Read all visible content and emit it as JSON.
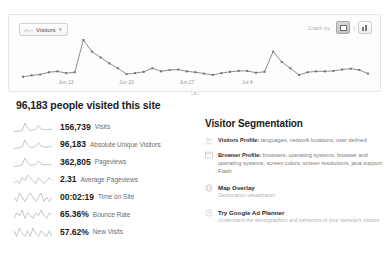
{
  "chart": {
    "metric_selector": {
      "label": "Visitors",
      "caret": "▾",
      "icon": "sparkline-icon"
    },
    "toolbar": {
      "right_label": "Graph by:",
      "line_view_title": "Line chart view",
      "separator": "|",
      "bar_view_title": "Bar chart view"
    },
    "expand_handle": "▾"
  },
  "chart_data": {
    "type": "line",
    "title": "Visitors",
    "xlabel": "",
    "ylabel": "Visitors",
    "grid": false,
    "legend": false,
    "axis_tick_labels": [
      "Jun 13",
      "Jun 20",
      "Jun 27",
      "Jul 4"
    ],
    "axis_tick_positions": [
      5,
      12,
      19,
      26
    ],
    "ylim": [
      0,
      100
    ],
    "x": [
      0,
      1,
      2,
      3,
      4,
      5,
      6,
      7,
      8,
      9,
      10,
      11,
      12,
      13,
      14,
      15,
      16,
      17,
      18,
      19,
      20,
      21,
      22,
      23,
      24,
      25,
      26,
      27,
      28,
      29,
      30,
      31,
      32,
      33,
      34,
      35,
      36,
      37,
      38,
      39,
      40
    ],
    "values": [
      14,
      17,
      19,
      24,
      26,
      22,
      24,
      96,
      70,
      57,
      44,
      33,
      20,
      22,
      25,
      33,
      26,
      29,
      30,
      26,
      24,
      21,
      18,
      22,
      25,
      27,
      27,
      23,
      25,
      70,
      47,
      33,
      18,
      24,
      26,
      26,
      27,
      30,
      32,
      29,
      21
    ],
    "series": [
      {
        "name": "Visitors",
        "values": [
          14,
          17,
          19,
          24,
          26,
          22,
          24,
          96,
          70,
          57,
          44,
          33,
          20,
          22,
          25,
          33,
          26,
          29,
          30,
          26,
          24,
          21,
          18,
          22,
          25,
          27,
          27,
          23,
          25,
          70,
          47,
          33,
          18,
          24,
          26,
          26,
          27,
          30,
          32,
          29,
          21
        ]
      }
    ]
  },
  "headline": "96,183 people visited this site",
  "metrics": [
    {
      "value": "156,739",
      "label": "Visits",
      "sparkline": [
        12,
        14,
        16,
        22,
        80,
        40,
        20,
        24,
        30,
        60,
        34,
        26,
        28,
        30,
        28
      ],
      "icon": "sparkline-icon"
    },
    {
      "value": "96,183",
      "label": "Absolute Unique Visitors",
      "sparkline": [
        14,
        16,
        20,
        26,
        78,
        42,
        22,
        24,
        28,
        58,
        32,
        24,
        26,
        28,
        26
      ],
      "icon": "sparkline-icon"
    },
    {
      "value": "362,805",
      "label": "Pageviews",
      "sparkline": [
        16,
        18,
        22,
        28,
        76,
        44,
        24,
        26,
        30,
        56,
        34,
        28,
        30,
        32,
        28
      ],
      "icon": "sparkline-icon"
    },
    {
      "value": "2.31",
      "label": "Average Pageviews",
      "sparkline": [
        30,
        31,
        30,
        32,
        31,
        33,
        32,
        31,
        30,
        32,
        31,
        30,
        31,
        32,
        31
      ],
      "icon": "sparkline-icon"
    },
    {
      "value": "00:02:19",
      "label": "Time on Site",
      "sparkline": [
        31,
        30,
        32,
        31,
        30,
        31,
        32,
        31,
        30,
        31,
        32,
        30,
        31,
        30,
        31
      ],
      "icon": "sparkline-icon"
    },
    {
      "value": "65.36%",
      "label": "Bounce Rate",
      "sparkline": [
        30,
        32,
        31,
        33,
        30,
        32,
        31,
        30,
        32,
        31,
        33,
        31,
        30,
        32,
        31
      ],
      "icon": "sparkline-icon"
    },
    {
      "value": "57.62%",
      "label": "New Visits",
      "sparkline": [
        32,
        30,
        33,
        31,
        30,
        32,
        30,
        33,
        31,
        30,
        32,
        31,
        30,
        32,
        30
      ],
      "icon": "sparkline-icon"
    }
  ],
  "segmentation": {
    "title": "Visitor Segmentation",
    "items": [
      {
        "icon": "people-icon",
        "title": "Visitors Profile:",
        "body": " languages, network locations, user defined"
      },
      {
        "icon": "browser-window-icon",
        "title": "Browser Profile:",
        "body": " browsers, operating systems, browser and operating systems, screen colors, screen resolutions, java support, Flash"
      }
    ],
    "links": [
      {
        "icon": "globe-icon",
        "title": "Map Overlay",
        "subtitle": "Geolocation visualization"
      },
      {
        "icon": "ad-planner-icon",
        "title": "Try Google Ad Planner",
        "subtitle": "Understand the demographics and behaviors of your website's visitors."
      }
    ]
  }
}
